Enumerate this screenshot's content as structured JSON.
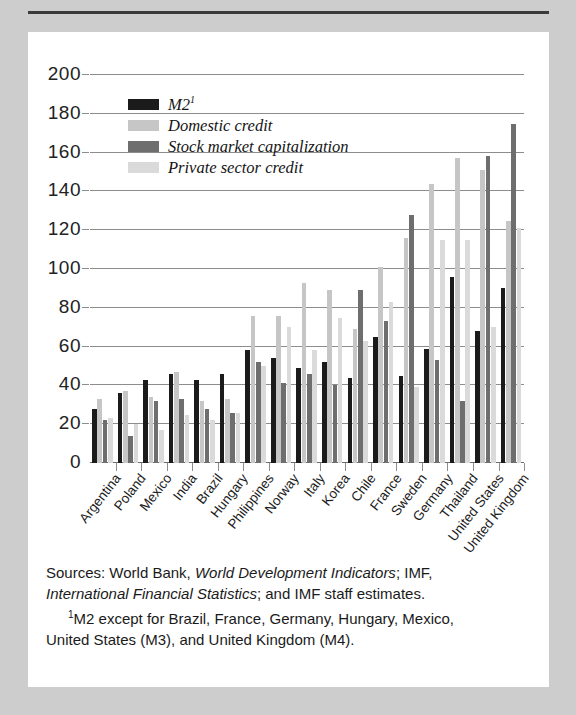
{
  "figure": {
    "background_color": "#cdcdcd",
    "panel_color": "#ffffff"
  },
  "legend": {
    "items": [
      {
        "label": "M2",
        "sup": "1",
        "color": "#1b1b1b",
        "key": "m2"
      },
      {
        "label": "Domestic credit",
        "sup": "",
        "color": "#c6c6c6",
        "key": "domestic_credit"
      },
      {
        "label": "Stock market capitalization",
        "sup": "",
        "color": "#6e6e6e",
        "key": "stock_market_capitalization"
      },
      {
        "label": "Private sector credit",
        "sup": "",
        "color": "#dadada",
        "key": "private_sector_credit"
      }
    ]
  },
  "notes": {
    "sources_line1_a": "Sources: World Bank, ",
    "sources_line1_i": "World Development Indicators",
    "sources_line1_b": "; IMF,",
    "sources_line2_i": "International Financial Statistics",
    "sources_line2_b": "; and IMF staff estimates.",
    "footnote_marker": "1",
    "footnote_line1": "M2 except for Brazil, France, Germany, Hungary, Mexico,",
    "footnote_line2": "United States (M3), and United Kingdom (M4)."
  },
  "chart_data": {
    "type": "bar",
    "title": "",
    "xlabel": "",
    "ylabel": "",
    "ylim": [
      0,
      200
    ],
    "yticks": [
      0,
      20,
      40,
      60,
      80,
      100,
      120,
      140,
      160,
      180,
      200
    ],
    "grid": true,
    "legend_position": "inside-top-left",
    "categories": [
      "Argentina",
      "Poland",
      "Mexico",
      "India",
      "Brazil",
      "Hungary",
      "Philippines",
      "Norway",
      "Italy",
      "Korea",
      "Chile",
      "France",
      "Sweden",
      "Germany",
      "Thailand",
      "United States",
      "United Kingdom"
    ],
    "series": [
      {
        "name": "M2",
        "color": "#1b1b1b",
        "values": [
          28,
          36,
          43,
          46,
          43,
          46,
          58,
          54,
          49,
          52,
          44,
          65,
          45,
          59,
          96,
          68,
          90
        ]
      },
      {
        "name": "Domestic credit",
        "color": "#c6c6c6",
        "values": [
          33,
          37,
          34,
          47,
          32,
          33,
          76,
          76,
          93,
          89,
          69,
          101,
          116,
          144,
          157,
          151,
          125
        ]
      },
      {
        "name": "Stock market capitalization",
        "color": "#6e6e6e",
        "values": [
          22,
          14,
          32,
          33,
          28,
          26,
          52,
          41,
          46,
          40,
          89,
          73,
          128,
          53,
          32,
          158,
          175
        ]
      },
      {
        "name": "Private sector credit",
        "color": "#dadada",
        "values": [
          23,
          20,
          17,
          25,
          22,
          26,
          50,
          70,
          58,
          75,
          63,
          83,
          39,
          115,
          115,
          70,
          121
        ]
      }
    ]
  }
}
